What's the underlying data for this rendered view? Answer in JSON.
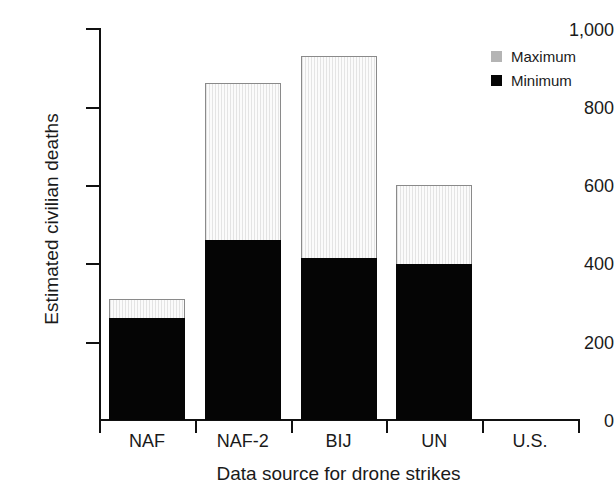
{
  "chart_data": {
    "type": "bar",
    "title": "",
    "subtitle": "",
    "xlabel": "Data source for drone strikes",
    "ylabel": "Estimated civilian deaths",
    "categories": [
      "NAF",
      "NAF-2",
      "BIJ",
      "UN",
      "U.S."
    ],
    "series": [
      {
        "name": "Minimum",
        "color": "#050505",
        "values": [
          262,
          460,
          414,
          400,
          null
        ]
      },
      {
        "name": "Maximum",
        "color": "#b4b4b4",
        "values": [
          310,
          863,
          932,
          600,
          null
        ]
      }
    ],
    "stacked": true,
    "ylim": [
      0,
      1000
    ],
    "yticks": [
      0,
      200,
      400,
      600,
      800,
      1000
    ],
    "ytick_labels": [
      "0",
      "200",
      "400",
      "600",
      "800",
      "1,000"
    ],
    "grid": false,
    "legend_position": "top-right",
    "annotations": [
      {
        "text": "?",
        "category": "U.S.",
        "value": 255,
        "note": "no data reported for U.S. source"
      }
    ]
  },
  "legend": {
    "items": [
      {
        "label": "Maximum",
        "swatch": "#b4b4b4"
      },
      {
        "label": "Minimum",
        "swatch": "#050505"
      }
    ]
  },
  "axes": {
    "y": {
      "label": "Estimated civilian deaths",
      "ticks": [
        "1,000",
        "800",
        "600",
        "400",
        "200",
        "0"
      ]
    },
    "x": {
      "label": "Data source for drone strikes",
      "ticks": [
        "NAF",
        "NAF-2",
        "BIJ",
        "UN",
        "U.S."
      ]
    }
  },
  "missing_data_marker": "?"
}
